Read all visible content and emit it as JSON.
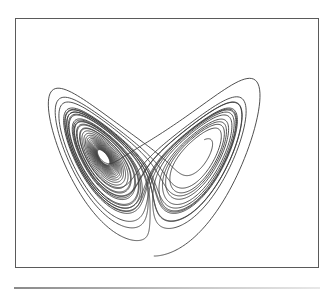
{
  "chart_data": {
    "type": "line",
    "title": "",
    "subtitle": "",
    "xlabel": "",
    "ylabel": "",
    "system": "lorenz",
    "parameters": {
      "sigma": 10,
      "rho": 28,
      "beta": 2.6667
    },
    "initial_state": [
      0.6,
      1.0,
      0.4
    ],
    "projection": {
      "horizontal": "x",
      "vertical": "z"
    },
    "xlim": [
      -20,
      20
    ],
    "ylim": [
      0,
      50
    ],
    "grid": false,
    "legend": null,
    "axes_ticks": false,
    "features": {
      "left_lobe_center": [
        -8.5,
        27
      ],
      "right_lobe_center": [
        8.5,
        27
      ]
    },
    "style": {
      "line_color": "#3c3c3c",
      "frame_color": "#5a5a5a",
      "background": "#ffffff"
    }
  }
}
